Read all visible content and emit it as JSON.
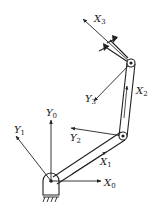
{
  "diagram": {
    "type": "planar-3-link-robot-arm-frames",
    "colors": {
      "stroke": "#222222",
      "background": "#ffffff"
    },
    "labels": {
      "x0": {
        "base": "X",
        "sub": "0"
      },
      "y0": {
        "base": "Y",
        "sub": "0"
      },
      "x1": {
        "base": "X",
        "sub": "1"
      },
      "y1": {
        "base": "Y",
        "sub": "1"
      },
      "x2": {
        "base": "X",
        "sub": "2"
      },
      "y2": {
        "base": "Y",
        "sub": "2"
      },
      "x3": {
        "base": "X",
        "sub": "3"
      },
      "y3": {
        "base": "Y",
        "sub": "3"
      }
    },
    "joints": [
      {
        "name": "base-joint",
        "x": 51,
        "y": 181
      },
      {
        "name": "joint-2",
        "x": 123,
        "y": 136
      },
      {
        "name": "joint-3",
        "x": 131,
        "y": 63
      }
    ]
  }
}
